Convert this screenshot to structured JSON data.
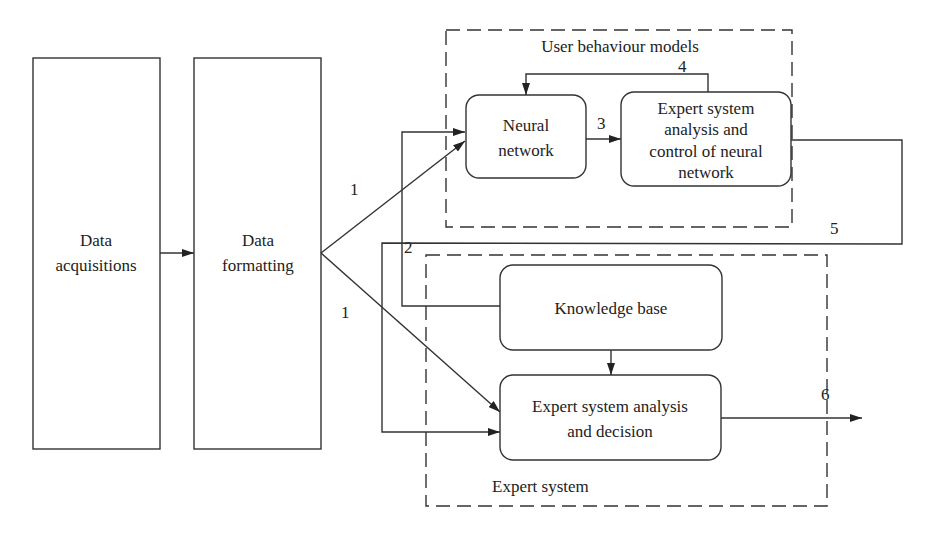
{
  "diagram": {
    "type": "flowchart",
    "nodes": {
      "data_acquisitions": {
        "line1": "Data",
        "line2": "acquisitions"
      },
      "data_formatting": {
        "line1": "Data",
        "line2": "formatting"
      },
      "neural_network": {
        "line1": "Neural",
        "line2": "network"
      },
      "expert_control": {
        "line1": "Expert system",
        "line2": "analysis and",
        "line3": "control of neural",
        "line4": "network"
      },
      "knowledge_base": {
        "line1": "Knowledge base"
      },
      "expert_decision": {
        "line1": "Expert system analysis",
        "line2": "and decision"
      }
    },
    "groups": {
      "user_behaviour": {
        "label": "User behaviour models"
      },
      "expert_system": {
        "label": "Expert system"
      }
    },
    "edge_labels": {
      "e1_up": "1",
      "e1_down": "1",
      "e2": "2",
      "e3": "3",
      "e4": "4",
      "e5": "5",
      "e6": "6"
    },
    "edges": [
      {
        "from": "Data acquisitions",
        "to": "Data formatting",
        "label": ""
      },
      {
        "from": "Data formatting",
        "to": "Neural network",
        "label": "1"
      },
      {
        "from": "Data formatting",
        "to": "Expert system analysis and decision",
        "label": "1"
      },
      {
        "from": "Knowledge base",
        "to": "Neural network",
        "label": "2"
      },
      {
        "from": "Neural network",
        "to": "Expert system analysis and control of neural network",
        "label": "3"
      },
      {
        "from": "Expert system analysis and control of neural network",
        "to": "Neural network",
        "label": "4"
      },
      {
        "from": "Expert system analysis and control of neural network",
        "to": "Expert system analysis and decision",
        "label": "5"
      },
      {
        "from": "Knowledge base",
        "to": "Expert system analysis and decision",
        "label": ""
      },
      {
        "from": "Expert system analysis and decision",
        "to": "output",
        "label": "6"
      }
    ]
  }
}
